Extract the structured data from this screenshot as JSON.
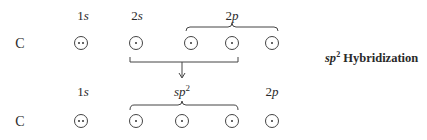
{
  "diagram": {
    "title": {
      "prefix": "sp",
      "superscript": "2",
      "text": "Hybridization"
    },
    "colors": {
      "ink": "#2a2a2a",
      "orbital_border": "#444444",
      "background": "#ffffff"
    },
    "before": {
      "atom": "C",
      "labels": [
        {
          "num": "1",
          "sub": "s"
        },
        {
          "num": "2",
          "sub": "s"
        },
        {
          "num": "2",
          "sub": "p"
        }
      ],
      "orbitals": [
        {
          "group": "1s",
          "electrons": 2
        },
        {
          "group": "2s",
          "electrons": 1
        },
        {
          "group": "2p",
          "electrons": 1
        },
        {
          "group": "2p",
          "electrons": 1
        },
        {
          "group": "2p",
          "electrons": 1
        }
      ],
      "brace_group": "2p",
      "bracket_group": "2s + 2 × 2p",
      "arrow": "down"
    },
    "after": {
      "atom": "C",
      "labels": [
        {
          "num": "1",
          "sub": "s"
        },
        {
          "prefix": "sp",
          "superscript": "2"
        },
        {
          "num": "2",
          "sub": "p"
        }
      ],
      "orbitals": [
        {
          "group": "1s",
          "electrons": 2
        },
        {
          "group": "sp2",
          "electrons": 1
        },
        {
          "group": "sp2",
          "electrons": 1
        },
        {
          "group": "sp2",
          "electrons": 1
        },
        {
          "group": "2p",
          "electrons": 1
        }
      ],
      "brace_group": "sp2"
    }
  }
}
